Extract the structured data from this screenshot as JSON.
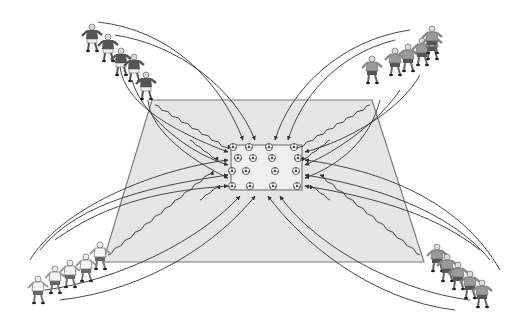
{
  "diagram": {
    "type": "soccer-drill",
    "colors": {
      "background": "#ffffff",
      "field_fill": "#e6e6e6",
      "field_edge": "#7a7a7a",
      "arrow": "#333333",
      "dark_team_shirt": "#5a5a5a",
      "light_team_shirt": "#f4f4f4",
      "mid_team_shirt": "#9a9a9a"
    },
    "field": {
      "shape": "trapezoid",
      "points": [
        [
          152,
          100
        ],
        [
          372,
          100
        ],
        [
          424,
          262
        ],
        [
          103,
          262
        ]
      ]
    },
    "center_zone": {
      "shape": "rectangle",
      "x": 231,
      "y": 145,
      "width": 71,
      "height": 45,
      "balls": [
        [
          233,
          147
        ],
        [
          249,
          147
        ],
        [
          269,
          147
        ],
        [
          294,
          147
        ],
        [
          238,
          158
        ],
        [
          253,
          158
        ],
        [
          272,
          158
        ],
        [
          298,
          158
        ],
        [
          232,
          171
        ],
        [
          246,
          171
        ],
        [
          275,
          171
        ],
        [
          296,
          171
        ],
        [
          232,
          186
        ],
        [
          250,
          186
        ],
        [
          273,
          186
        ],
        [
          297,
          186
        ]
      ]
    },
    "groups": [
      {
        "name": "top-left",
        "team": "dark",
        "count": 5,
        "anchor": [
          152,
          100
        ]
      },
      {
        "name": "top-right",
        "team": "mid",
        "count": 6,
        "anchor": [
          372,
          100
        ]
      },
      {
        "name": "bottom-left",
        "team": "light",
        "count": 6,
        "anchor": [
          103,
          262
        ]
      },
      {
        "name": "bottom-right",
        "team": "mid",
        "count": 6,
        "anchor": [
          424,
          262
        ]
      }
    ]
  }
}
